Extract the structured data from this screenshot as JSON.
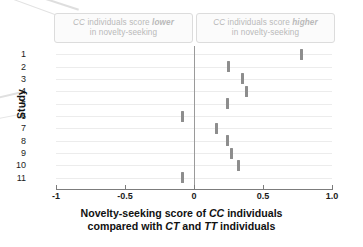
{
  "annotations": {
    "left_banner": {
      "line1_prefix": "CC",
      "line1_mid": " individuals score ",
      "line1_emphasis": "lower",
      "line2": "in novelty-seeking"
    },
    "right_banner": {
      "line1_prefix": "CC",
      "line1_mid": " individuals score ",
      "line1_emphasis": "higher",
      "line2": "in novelty-seeking"
    }
  },
  "axes": {
    "y_title": "Study",
    "x_title_line1_a": "Novelty-seeking score of ",
    "x_title_line1_b": "CC",
    "x_title_line1_c": " individuals",
    "x_title_line2_a": "compared with ",
    "x_title_line2_b": "CT",
    "x_title_line2_c": " and ",
    "x_title_line2_d": "TT",
    "x_title_line2_e": " individuals"
  },
  "colors": {
    "marker": "#8d8d8d",
    "zero_line": "#9a9a9a",
    "gridline": "#ececec",
    "banner_text": "#b9b9b9",
    "banner_border": "#dcdcdc",
    "axis": "#7c7c7c"
  },
  "chart_data": {
    "type": "scatter",
    "title": "",
    "subtitle": "",
    "xlabel": "Novelty-seeking score of CC individuals compared with CT and TT individuals",
    "ylabel": "Study",
    "xlim": [
      -1,
      1
    ],
    "xticks": [
      -1,
      -0.5,
      0,
      0.5,
      1
    ],
    "xtick_labels": [
      "-1",
      "-0.5",
      "0",
      "0.5",
      "1.0"
    ],
    "grid": true,
    "legend": "none",
    "reference_line": 0,
    "categories": [
      "1",
      "2",
      "3",
      "4",
      "5",
      "6",
      "7",
      "8",
      "9",
      "10",
      "11"
    ],
    "values": [
      0.78,
      0.25,
      0.355,
      0.38,
      0.245,
      -0.085,
      0.165,
      0.245,
      0.275,
      0.32,
      -0.08
    ],
    "series": [
      {
        "name": "Effect estimate",
        "points": [
          {
            "study": "1",
            "value": 0.78
          },
          {
            "study": "2",
            "value": 0.25
          },
          {
            "study": "3",
            "value": 0.355
          },
          {
            "study": "4",
            "value": 0.38
          },
          {
            "study": "5",
            "value": 0.245
          },
          {
            "study": "6",
            "value": -0.085
          },
          {
            "study": "7",
            "value": 0.165
          },
          {
            "study": "8",
            "value": 0.245
          },
          {
            "study": "9",
            "value": 0.275
          },
          {
            "study": "10",
            "value": 0.32
          },
          {
            "study": "11",
            "value": -0.08
          }
        ]
      }
    ]
  }
}
